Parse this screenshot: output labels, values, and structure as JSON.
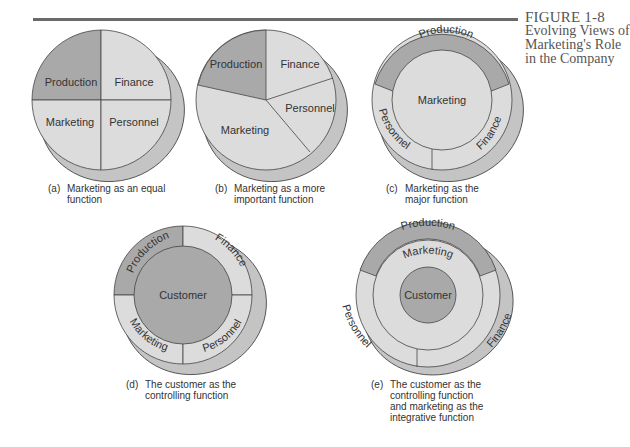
{
  "figure": {
    "number": "FIGURE 1-8",
    "title": "Evolving Views of Marketing's Role in the Company"
  },
  "colors": {
    "dark_segment": "#a9a9a9",
    "light_segment": "#dcdcdc",
    "shadow": "#c4c4c4",
    "stroke": "#444444",
    "rule": "#6a6a6a"
  },
  "diagrams": [
    {
      "id": "a",
      "tag": "(a)",
      "caption": "Marketing as an equal function",
      "segments": [
        "Production",
        "Finance",
        "Marketing",
        "Personnel"
      ]
    },
    {
      "id": "b",
      "tag": "(b)",
      "caption": "Marketing as a more important function",
      "segments": [
        "Production",
        "Finance",
        "Personnel",
        "Marketing"
      ]
    },
    {
      "id": "c",
      "tag": "(c)",
      "caption": "Marketing as the major function",
      "center": "Marketing",
      "ring": [
        "Production",
        "Finance",
        "Personnel"
      ]
    },
    {
      "id": "d",
      "tag": "(d)",
      "caption": "The customer as the controlling function",
      "center": "Customer",
      "ring": [
        "Production",
        "Finance",
        "Marketing",
        "Personnel"
      ]
    },
    {
      "id": "e",
      "tag": "(e)",
      "caption": "The customer as the controlling function and marketing as the integrative function",
      "center": "Customer",
      "middle_ring": "Marketing",
      "outer_ring": [
        "Production",
        "Finance",
        "Personnel"
      ]
    }
  ]
}
